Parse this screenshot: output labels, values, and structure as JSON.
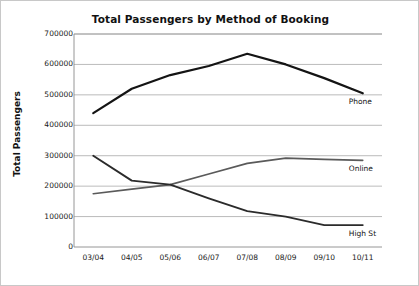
{
  "chart_data": {
    "type": "line",
    "title": "Total Passengers by Method of Booking",
    "xlabel": "",
    "ylabel": "Total Passengers",
    "categories": [
      "03/04",
      "04/05",
      "05/06",
      "06/07",
      "07/08",
      "08/09",
      "09/10",
      "10/11"
    ],
    "yticks": [
      "0",
      "100000",
      "200000",
      "300000",
      "400000",
      "500000",
      "600000",
      "700000"
    ],
    "ylim": [
      0,
      700000
    ],
    "grid": true,
    "legend_position": "right-inline-labels",
    "series": [
      {
        "name": "Phone",
        "color": "#141414",
        "values": [
          440000,
          520000,
          565000,
          595000,
          635000,
          600000,
          555000,
          505000
        ]
      },
      {
        "name": "Online",
        "color": "#5a5a5a",
        "values": [
          175000,
          190000,
          205000,
          240000,
          275000,
          292000,
          288000,
          285000
        ]
      },
      {
        "name": "High St",
        "color": "#2b2b2b",
        "values": [
          300000,
          218000,
          205000,
          160000,
          118000,
          100000,
          72000,
          72000
        ]
      }
    ]
  }
}
